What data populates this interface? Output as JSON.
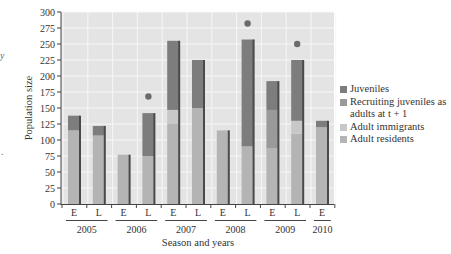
{
  "chart_data": {
    "type": "bar",
    "stacked": true,
    "title": "",
    "xlabel": "Season and years",
    "ylabel": "Population size",
    "ylim": [
      0,
      300
    ],
    "yticks": [
      0,
      25,
      50,
      75,
      100,
      125,
      150,
      175,
      200,
      225,
      250,
      275,
      300
    ],
    "grid": true,
    "legend_position": "right",
    "categories": [
      "2005 E",
      "2005 L",
      "2006 E",
      "2006 L",
      "2007 E",
      "2007 L",
      "2008 E",
      "2008 L",
      "2009 E",
      "2009 L",
      "2010 E"
    ],
    "season_labels": [
      "E",
      "L",
      "E",
      "L",
      "E",
      "L",
      "E",
      "L",
      "E",
      "L",
      "E"
    ],
    "year_labels": [
      "2005",
      "2006",
      "2007",
      "2008",
      "2009",
      "2010"
    ],
    "series": [
      {
        "name": "Adult residents",
        "color": "#b4b4b4",
        "values": [
          115,
          107,
          77,
          75,
          125,
          150,
          115,
          90,
          87,
          110,
          120
        ]
      },
      {
        "name": "Adult immigrants",
        "color": "#c8c8c8",
        "values": [
          0,
          0,
          0,
          0,
          22,
          0,
          0,
          0,
          0,
          20,
          0
        ]
      },
      {
        "name": "Recruiting juveniles as adults at t + 1",
        "color": "#9a9a9a",
        "values": [
          0,
          0,
          0,
          0,
          0,
          0,
          0,
          0,
          60,
          0,
          0
        ]
      },
      {
        "name": "Juveniles",
        "color": "#7d7d7d",
        "values": [
          23,
          15,
          0,
          67,
          108,
          75,
          0,
          167,
          45,
          95,
          10
        ]
      }
    ],
    "totals": [
      138,
      122,
      77,
      142,
      255,
      225,
      115,
      257,
      192,
      225,
      130
    ],
    "markers": [
      {
        "category": "2006 L",
        "value": 168
      },
      {
        "category": "2008 L",
        "value": 282
      },
      {
        "category": "2009 L",
        "value": 250
      }
    ]
  },
  "legend": {
    "items": [
      {
        "label": "Juveniles",
        "color": "#7d7d7d"
      },
      {
        "label": "Recruiting juveniles as adults at t + 1",
        "color": "#9a9a9a"
      },
      {
        "label": "Adult immigrants",
        "color": "#c8c8c8"
      },
      {
        "label": "Adult residents",
        "color": "#b4b4b4"
      }
    ]
  },
  "edge_text": {
    "top": "y",
    "bottom": "."
  }
}
